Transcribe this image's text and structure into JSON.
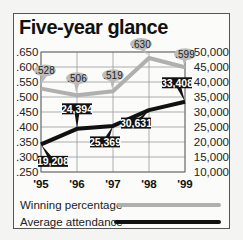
{
  "chart_data": {
    "type": "line",
    "title": "Five-year glance",
    "categories": [
      "'95",
      "'96",
      "'97",
      "'98",
      "'99"
    ],
    "series": [
      {
        "name": "Winning percentage",
        "axis": "left",
        "color": "#b0b0b0",
        "values": [
          0.528,
          0.506,
          0.519,
          0.63,
          0.599
        ],
        "labels": [
          ".528",
          ".506",
          ".519",
          ".630",
          ".599"
        ]
      },
      {
        "name": "Average attendance",
        "axis": "right",
        "color": "#111111",
        "values": [
          19208,
          24394,
          25369,
          30631,
          33408
        ],
        "labels": [
          "19,208",
          "24,394",
          "25,369",
          "30,631",
          "33,408"
        ]
      }
    ],
    "left_axis": {
      "ylim": [
        0.25,
        0.65
      ],
      "ticks": [
        0.65,
        0.6,
        0.55,
        0.5,
        0.45,
        0.4,
        0.35,
        0.3,
        0.25
      ],
      "tick_labels": [
        ".650",
        ".600",
        ".550",
        ".500",
        ".450",
        ".400",
        ".350",
        ".300",
        ".250"
      ]
    },
    "right_axis": {
      "ylim": [
        10000,
        50000
      ],
      "ticks": [
        50000,
        45000,
        40000,
        35000,
        30000,
        25000,
        20000,
        15000,
        10000
      ],
      "tick_labels": [
        "50,000",
        "45,000",
        "40,000",
        "35,000",
        "30,000",
        "25,000",
        "20,000",
        "15,000",
        "10,000"
      ]
    },
    "grid": true,
    "legend": "bottom"
  }
}
